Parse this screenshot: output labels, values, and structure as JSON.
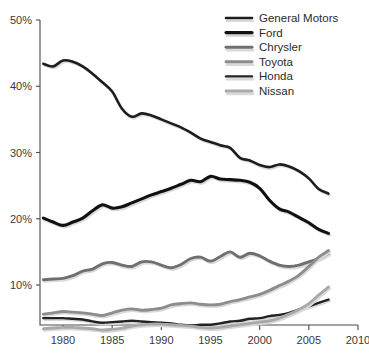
{
  "chart_data": {
    "type": "line",
    "title": "",
    "subtitle": "",
    "xlabel": "",
    "ylabel": "",
    "xlim": [
      1977,
      2010
    ],
    "ylim": [
      0,
      50
    ],
    "grid": false,
    "legend_position": "top-right",
    "x_ticks": [
      "1980",
      "1985",
      "1990",
      "1995",
      "2000",
      "2005",
      "2010"
    ],
    "x_tick_values": [
      1980,
      1985,
      1990,
      1995,
      2000,
      2005,
      2010
    ],
    "y_ticks": [
      "10%",
      "20%",
      "30%",
      "40%",
      "50%"
    ],
    "y_tick_values": [
      10,
      20,
      30,
      40,
      50
    ],
    "x": [
      1978,
      1979,
      1980,
      1981,
      1982,
      1983,
      1984,
      1985,
      1986,
      1987,
      1988,
      1989,
      1990,
      1991,
      1992,
      1993,
      1994,
      1995,
      1996,
      1997,
      1998,
      1999,
      2000,
      2001,
      2002,
      2003,
      2004,
      2005,
      2006,
      2007
    ],
    "series": [
      {
        "name": "General Motors",
        "color": "#1d1d1d",
        "width": 2.6,
        "values": [
          43.4,
          43.0,
          43.9,
          43.7,
          43.0,
          41.9,
          40.6,
          39.2,
          36.6,
          35.4,
          35.9,
          35.6,
          35.0,
          34.4,
          33.8,
          33.0,
          32.1,
          31.6,
          31.1,
          30.7,
          29.2,
          28.8,
          28.1,
          27.8,
          28.2,
          27.9,
          27.2,
          26.1,
          24.5,
          23.8
        ]
      },
      {
        "name": "Ford",
        "color": "#111111",
        "width": 3.1,
        "values": [
          20.1,
          19.5,
          19.0,
          19.5,
          20.1,
          21.2,
          22.1,
          21.6,
          21.8,
          22.4,
          23.0,
          23.6,
          24.1,
          24.6,
          25.2,
          25.8,
          25.6,
          26.4,
          26.0,
          25.9,
          25.8,
          25.5,
          24.6,
          22.8,
          21.5,
          21.0,
          20.2,
          19.4,
          18.4,
          17.8
        ]
      },
      {
        "name": "Chrysler",
        "color": "#6f6f6f",
        "width": 2.9,
        "values": [
          10.8,
          10.9,
          11.0,
          11.4,
          12.1,
          12.4,
          13.2,
          13.4,
          13.0,
          12.8,
          13.5,
          13.5,
          13.0,
          12.6,
          13.1,
          14.0,
          14.2,
          13.6,
          14.3,
          15.0,
          14.2,
          14.8,
          14.4,
          13.6,
          13.0,
          12.8,
          13.0,
          13.5,
          14.0,
          14.8
        ]
      },
      {
        "name": "Toyota",
        "color": "#8d8d8d",
        "width": 2.9,
        "values": [
          5.6,
          5.8,
          6.0,
          5.9,
          5.8,
          5.6,
          5.4,
          5.8,
          6.2,
          6.4,
          6.2,
          6.3,
          6.5,
          7.0,
          7.2,
          7.3,
          7.1,
          7.0,
          7.1,
          7.5,
          7.8,
          8.2,
          8.6,
          9.2,
          9.9,
          10.6,
          11.5,
          12.8,
          14.2,
          15.2
        ]
      },
      {
        "name": "Honda",
        "color": "#222222",
        "width": 2.4,
        "values": [
          5.0,
          5.0,
          5.0,
          4.9,
          4.8,
          4.5,
          4.3,
          4.4,
          4.5,
          4.6,
          4.5,
          4.4,
          4.3,
          4.2,
          4.0,
          3.9,
          4.0,
          4.0,
          4.2,
          4.5,
          4.6,
          4.9,
          5.0,
          5.3,
          5.5,
          5.8,
          6.3,
          6.8,
          7.3,
          7.8
        ]
      },
      {
        "name": "Nissan",
        "color": "#a9a9a9",
        "width": 2.9,
        "values": [
          3.4,
          3.5,
          3.6,
          3.6,
          3.5,
          3.4,
          3.2,
          3.3,
          3.5,
          3.8,
          4.0,
          4.1,
          4.1,
          4.0,
          3.9,
          3.8,
          3.6,
          3.5,
          3.6,
          3.8,
          4.0,
          4.2,
          4.4,
          4.6,
          5.0,
          5.6,
          6.3,
          7.2,
          8.5,
          9.7
        ]
      }
    ]
  },
  "legend": {
    "entries": [
      {
        "label": "General Motors"
      },
      {
        "label": "Ford"
      },
      {
        "label": "Chrysler"
      },
      {
        "label": "Toyota"
      },
      {
        "label": "Honda"
      },
      {
        "label": "Nissan"
      }
    ]
  }
}
